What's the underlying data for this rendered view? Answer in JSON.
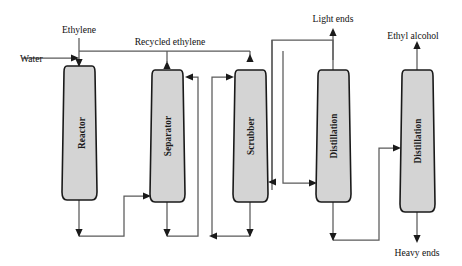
{
  "diagram": {
    "background_color": "#ffffff",
    "vessel_fill_color": "#d4d4d4",
    "vessel_stroke_color": "#1a1a1a",
    "line_color": "#5a5a5a",
    "arrow_color": "#1a1a1a",
    "units": [
      {
        "id": "reactor",
        "label": "Reactor",
        "x": 64,
        "y": 66,
        "width": 31,
        "height": 134
      },
      {
        "id": "separator",
        "label": "Separator",
        "x": 152,
        "y": 70,
        "width": 31,
        "height": 132
      },
      {
        "id": "scrubber",
        "label": "Scrubber",
        "x": 235,
        "y": 70,
        "width": 31,
        "height": 132
      },
      {
        "id": "distillation-1",
        "label": "Distillation",
        "x": 318,
        "y": 70,
        "width": 31,
        "height": 132
      },
      {
        "id": "distillation-2",
        "label": "Distillation",
        "x": 402,
        "y": 70,
        "width": 31,
        "height": 142
      }
    ],
    "streams": [
      {
        "id": "water",
        "label": "Water",
        "x": 20,
        "y": 62,
        "anchor": "start"
      },
      {
        "id": "ethylene",
        "label": "Ethylene",
        "x": 79,
        "y": 33,
        "anchor": "middle"
      },
      {
        "id": "recycled-ethylene",
        "label": "Recycled ethylene",
        "x": 170,
        "y": 45,
        "anchor": "middle"
      },
      {
        "id": "light-ends",
        "label": "Light ends",
        "x": 333,
        "y": 22,
        "anchor": "middle"
      },
      {
        "id": "ethyl-alcohol",
        "label": "Ethyl alcohol",
        "x": 413,
        "y": 39,
        "anchor": "middle"
      },
      {
        "id": "heavy-ends",
        "label": "Heavy ends",
        "x": 417,
        "y": 253,
        "anchor": "middle"
      }
    ]
  }
}
